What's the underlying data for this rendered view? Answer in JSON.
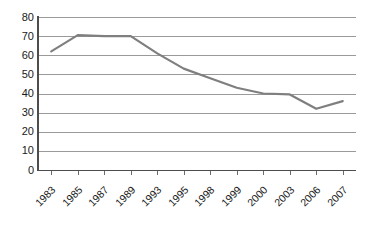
{
  "chart_data": {
    "type": "line",
    "title": "",
    "subtitle": "",
    "xlabel": "",
    "ylabel": "",
    "categories": [
      "1983",
      "1985",
      "1987",
      "1989",
      "1993",
      "1995",
      "1998",
      "1999",
      "2000",
      "2003",
      "2006",
      "2007"
    ],
    "series": [
      {
        "name": "Series 1",
        "values": [
          62,
          70.5,
          70,
          70,
          61,
          53,
          48,
          43,
          40,
          39.5,
          32,
          36
        ],
        "color": "#7f7f7f"
      }
    ],
    "ylim": [
      0,
      80
    ],
    "y_ticks": [
      "80",
      "70",
      "60",
      "50",
      "40",
      "30",
      "20",
      "10",
      "0"
    ],
    "y_tick_values": [
      80,
      70,
      60,
      50,
      40,
      30,
      20,
      10,
      0
    ],
    "grid": true,
    "grid_color": "#9a9a9a",
    "legend": false,
    "legend_position": "none",
    "axis_color": "#4d4d4d",
    "background": "#ffffff",
    "annotations": []
  }
}
